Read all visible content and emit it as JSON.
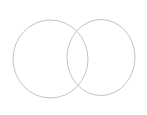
{
  "canvas": {
    "width": 147,
    "height": 115,
    "view_box": "0 0 147 115",
    "background": "#ffffff"
  },
  "diagram": {
    "type": "venn-outline",
    "stroke_color": "#c4c4c4",
    "stroke_width": 1,
    "fill": "none",
    "circles": [
      {
        "name": "left-circle",
        "cx": 50.5,
        "cy": 59,
        "rx": 37.5,
        "ry": 39
      },
      {
        "name": "right-circle",
        "cx": 101,
        "cy": 57.5,
        "rx": 34,
        "ry": 38
      }
    ]
  }
}
